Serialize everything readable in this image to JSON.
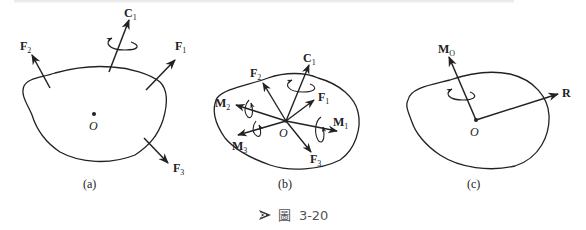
{
  "figure": {
    "caption_prefix": "圖",
    "caption_number": "3-20",
    "panels": [
      {
        "id": "a",
        "label": "(a)",
        "origin": "O",
        "vectors": [
          {
            "name": "F",
            "sub": "2"
          },
          {
            "name": "C",
            "sub": "1"
          },
          {
            "name": "F",
            "sub": "1"
          },
          {
            "name": "F",
            "sub": "3"
          }
        ]
      },
      {
        "id": "b",
        "label": "(b)",
        "origin": "O",
        "vectors": [
          {
            "name": "F",
            "sub": "2"
          },
          {
            "name": "C",
            "sub": "1"
          },
          {
            "name": "F",
            "sub": "1"
          },
          {
            "name": "M",
            "sub": "2"
          },
          {
            "name": "M",
            "sub": "1"
          },
          {
            "name": "M",
            "sub": "3"
          },
          {
            "name": "F",
            "sub": "3"
          }
        ]
      },
      {
        "id": "c",
        "label": "(c)",
        "origin": "O",
        "vectors": [
          {
            "name": "M",
            "sub": "O"
          },
          {
            "name": "R",
            "sub": ""
          }
        ]
      }
    ]
  },
  "colors": {
    "line": "#222222",
    "caption_text": "#555555",
    "caption_icon": "#333333"
  }
}
